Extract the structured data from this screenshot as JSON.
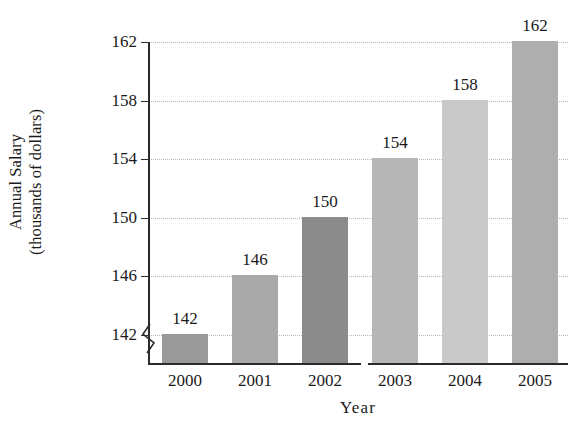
{
  "chart_data": {
    "type": "bar",
    "title": "",
    "xlabel": "Year",
    "ylabel": "Annual Salary (thousands of dollars)",
    "ylabel_lines": [
      "Annual Salary",
      "(thousands of dollars)"
    ],
    "categories": [
      "2000",
      "2001",
      "2002",
      "2003",
      "2004",
      "2005"
    ],
    "values": [
      142,
      146,
      150,
      154,
      158,
      162
    ],
    "value_labels": [
      "142",
      "146",
      "150",
      "154",
      "158",
      "162"
    ],
    "ylim": [
      140,
      162
    ],
    "yticks": [
      142,
      146,
      150,
      154,
      158,
      162
    ],
    "ytick_labels": [
      "142",
      "146",
      "150",
      "154",
      "158",
      "162"
    ],
    "grid": "horizontal-dotted",
    "legend": "none",
    "axis_break": "y-axis broken below 142",
    "bar_colors": [
      "#9a9a9a",
      "#a9a9a9",
      "#8b8b8b",
      "#b6b6b6",
      "#c9c9c9",
      "#aeaeae"
    ],
    "series": [
      {
        "name": "Annual Salary",
        "values": [
          142,
          146,
          150,
          154,
          158,
          162
        ]
      }
    ],
    "bars": [
      {
        "category": "2000",
        "value": 142,
        "label": "142",
        "color": "#9a9a9a"
      },
      {
        "category": "2001",
        "value": 146,
        "label": "146",
        "color": "#a9a9a9"
      },
      {
        "category": "2002",
        "value": 150,
        "label": "150",
        "color": "#8b8b8b"
      },
      {
        "category": "2003",
        "value": 154,
        "label": "154",
        "color": "#b6b6b6"
      },
      {
        "category": "2004",
        "value": 158,
        "label": "158",
        "color": "#c9c9c9"
      },
      {
        "category": "2005",
        "value": 162,
        "label": "162",
        "color": "#aeaeae"
      }
    ],
    "colors": {
      "background": "#ffffff",
      "axis": "#2b2b2b",
      "gridline": "#b9b9b9",
      "text": "#1a1a1a"
    }
  }
}
